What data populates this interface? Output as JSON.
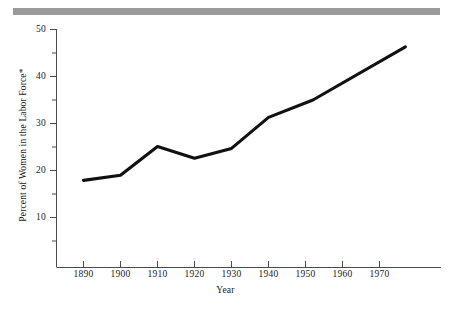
{
  "figure": {
    "background_color": "#ffffff",
    "rule_color": "#9a9a9a",
    "line_color": "#111111",
    "axis_color": "#4a4a4a"
  },
  "chart_data": {
    "type": "line",
    "title": "",
    "xlabel": "Year",
    "ylabel": "Percent of Women in the Labor Force*",
    "xlim": [
      1884,
      1980
    ],
    "ylim": [
      3,
      50
    ],
    "grid": false,
    "legend": "none",
    "x_ticks": [
      1890,
      1900,
      1910,
      1920,
      1930,
      1940,
      1950,
      1960,
      1970
    ],
    "x_tick_labels": [
      "1890",
      "1900",
      "1910",
      "1920",
      "1930",
      "1940",
      "1950",
      "1960",
      "1970"
    ],
    "y_ticks": [
      10,
      20,
      30,
      40,
      50
    ],
    "y_tick_labels": [
      "10",
      "20",
      "30",
      "40",
      "50"
    ],
    "y_minor_ticks": [
      5,
      15,
      25,
      35,
      45
    ],
    "x": [
      1890,
      1900,
      1910,
      1920,
      1930,
      1940,
      1952,
      1977
    ],
    "values": [
      17.9,
      19.0,
      25.1,
      22.6,
      24.7,
      31.3,
      35.0,
      46.3
    ],
    "series": [
      {
        "name": "Percent of Women in the Labor Force",
        "x": [
          1890,
          1900,
          1910,
          1920,
          1930,
          1940,
          1952,
          1977
        ],
        "values": [
          17.9,
          19.0,
          25.1,
          22.6,
          24.7,
          31.3,
          35.0,
          46.3
        ]
      }
    ],
    "annotations": [
      "*"
    ]
  },
  "axes": {
    "y_title": "Percent of Women in the Labor Force*",
    "x_title": "Year"
  }
}
